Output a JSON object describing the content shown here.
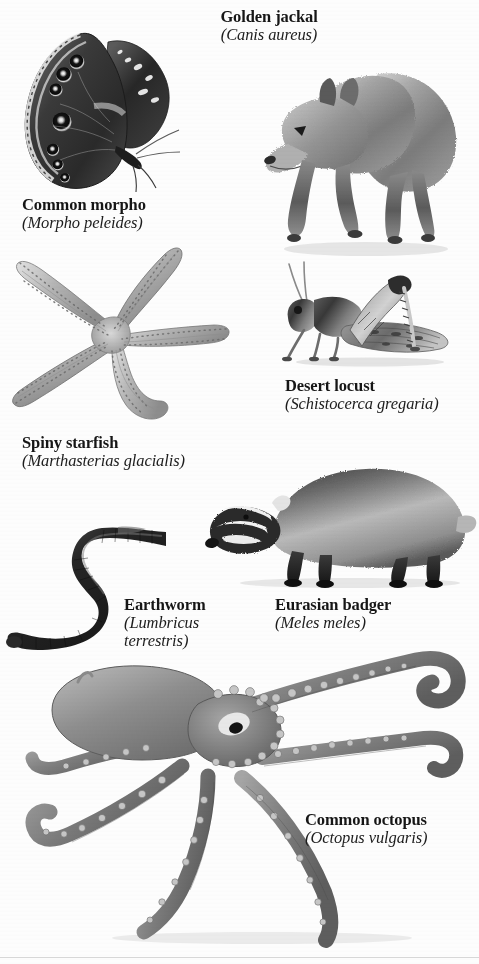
{
  "page": {
    "background_color": "#fdfdfd",
    "text_color": "#161616",
    "bottom_rule_color": "#d7d7d7",
    "style": "black-and-white photographic plate of animals with serif captions"
  },
  "specimens": [
    {
      "id": "common-morpho",
      "common_name": "Common morpho",
      "scientific_name": "(Morpho peleides)",
      "group": "butterfly",
      "caption_lines": 2
    },
    {
      "id": "golden-jackal",
      "common_name": "Golden jackal",
      "scientific_name": "(Canis aureus)",
      "group": "mammal",
      "caption_lines": 2
    },
    {
      "id": "spiny-starfish",
      "common_name": "Spiny starfish",
      "scientific_name": "(Marthasterias glacialis)",
      "group": "echinoderm",
      "caption_lines": 2
    },
    {
      "id": "desert-locust",
      "common_name": "Desert locust",
      "scientific_name": "(Schistocerca gregaria)",
      "group": "insect",
      "caption_lines": 2
    },
    {
      "id": "earthworm",
      "common_name": "Earthworm",
      "scientific_name_line1": "(Lumbricus",
      "scientific_name_line2": "terrestris)",
      "group": "annelid",
      "caption_lines": 3
    },
    {
      "id": "eurasian-badger",
      "common_name": "Eurasian badger",
      "scientific_name": "(Meles meles)",
      "group": "mammal",
      "caption_lines": 2
    },
    {
      "id": "common-octopus",
      "common_name": "Common octopus",
      "scientific_name": "(Octopus vulgaris)",
      "group": "cephalopod",
      "caption_lines": 2
    }
  ]
}
